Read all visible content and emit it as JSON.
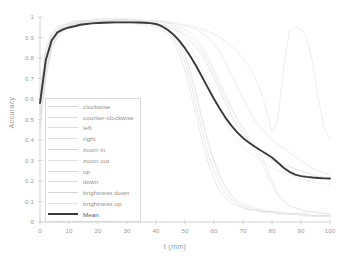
{
  "chart_data": {
    "type": "line",
    "title": "",
    "xlabel": "t (mm)",
    "ylabel": "Accuracy",
    "xlim": [
      0,
      100
    ],
    "ylim": [
      0,
      1
    ],
    "xticks": [
      0,
      10,
      20,
      30,
      40,
      50,
      60,
      70,
      80,
      90,
      100
    ],
    "xtick_labels": [
      "0",
      "10",
      "20",
      "30",
      "40",
      "50",
      "60",
      "70",
      "80",
      "90",
      "100"
    ],
    "yticks": [
      0,
      0.1,
      0.2,
      0.3,
      0.4,
      0.5,
      0.6,
      0.7,
      0.8,
      0.9,
      1
    ],
    "ytick_labels": [
      "0",
      "0.1",
      "0.2",
      "0.3",
      "0.4",
      "0.5",
      "0.6",
      "0.7",
      "0.8",
      "0.9",
      "1"
    ],
    "grid": false,
    "legend_position": "lower-left",
    "x": [
      0,
      2,
      4,
      6,
      8,
      10,
      12,
      14,
      16,
      18,
      20,
      22,
      24,
      26,
      28,
      30,
      32,
      34,
      36,
      38,
      40,
      42,
      44,
      46,
      48,
      50,
      52,
      54,
      56,
      58,
      60,
      62,
      64,
      66,
      68,
      70,
      72,
      74,
      76,
      78,
      80,
      82,
      84,
      86,
      88,
      90,
      92,
      94,
      96,
      98,
      100
    ],
    "series": [
      {
        "name": "clockwise",
        "color": "#d9d9d9",
        "values": [
          0.52,
          0.76,
          0.88,
          0.93,
          0.95,
          0.96,
          0.97,
          0.97,
          0.98,
          0.98,
          0.98,
          0.98,
          0.98,
          0.98,
          0.98,
          0.98,
          0.98,
          0.98,
          0.97,
          0.97,
          0.96,
          0.95,
          0.93,
          0.9,
          0.85,
          0.78,
          0.68,
          0.56,
          0.44,
          0.33,
          0.25,
          0.19,
          0.14,
          0.11,
          0.09,
          0.07,
          0.06,
          0.06,
          0.05,
          0.05,
          0.05,
          0.04,
          0.04,
          0.04,
          0.04,
          0.04,
          0.03,
          0.03,
          0.03,
          0.03,
          0.03
        ]
      },
      {
        "name": "counter-clockwise",
        "color": "#dedede",
        "values": [
          0.55,
          0.74,
          0.86,
          0.92,
          0.94,
          0.96,
          0.96,
          0.97,
          0.97,
          0.97,
          0.98,
          0.98,
          0.98,
          0.98,
          0.98,
          0.98,
          0.98,
          0.97,
          0.97,
          0.97,
          0.96,
          0.95,
          0.94,
          0.92,
          0.88,
          0.82,
          0.73,
          0.62,
          0.5,
          0.39,
          0.3,
          0.23,
          0.17,
          0.13,
          0.1,
          0.08,
          0.07,
          0.06,
          0.06,
          0.05,
          0.05,
          0.05,
          0.04,
          0.04,
          0.04,
          0.04,
          0.04,
          0.03,
          0.03,
          0.03,
          0.03
        ]
      },
      {
        "name": "left",
        "color": "#dcdcdc",
        "values": [
          0.6,
          0.82,
          0.91,
          0.94,
          0.96,
          0.97,
          0.97,
          0.98,
          0.98,
          0.98,
          0.98,
          0.98,
          0.98,
          0.99,
          0.99,
          0.99,
          0.98,
          0.98,
          0.98,
          0.98,
          0.98,
          0.97,
          0.97,
          0.96,
          0.95,
          0.94,
          0.92,
          0.89,
          0.85,
          0.8,
          0.74,
          0.68,
          0.62,
          0.56,
          0.5,
          0.46,
          0.42,
          0.38,
          0.33,
          0.27,
          0.2,
          0.14,
          0.1,
          0.08,
          0.07,
          0.06,
          0.05,
          0.05,
          0.05,
          0.04,
          0.04
        ]
      },
      {
        "name": "right",
        "color": "#e0e0e0",
        "values": [
          0.58,
          0.8,
          0.9,
          0.94,
          0.95,
          0.96,
          0.97,
          0.97,
          0.98,
          0.98,
          0.98,
          0.98,
          0.98,
          0.98,
          0.98,
          0.98,
          0.98,
          0.98,
          0.98,
          0.97,
          0.97,
          0.96,
          0.96,
          0.95,
          0.94,
          0.92,
          0.9,
          0.87,
          0.83,
          0.78,
          0.72,
          0.66,
          0.6,
          0.55,
          0.5,
          0.45,
          0.4,
          0.35,
          0.3,
          0.24,
          0.18,
          0.13,
          0.1,
          0.08,
          0.07,
          0.06,
          0.05,
          0.05,
          0.04,
          0.04,
          0.04
        ]
      },
      {
        "name": "zoom in",
        "color": "#d6d6d6",
        "values": [
          0.45,
          0.7,
          0.84,
          0.9,
          0.93,
          0.95,
          0.96,
          0.96,
          0.97,
          0.97,
          0.97,
          0.97,
          0.97,
          0.97,
          0.97,
          0.97,
          0.97,
          0.96,
          0.96,
          0.96,
          0.95,
          0.94,
          0.92,
          0.88,
          0.82,
          0.74,
          0.63,
          0.51,
          0.39,
          0.29,
          0.21,
          0.15,
          0.12,
          0.09,
          0.08,
          0.07,
          0.06,
          0.06,
          0.05,
          0.05,
          0.05,
          0.04,
          0.04,
          0.04,
          0.04,
          0.03,
          0.03,
          0.03,
          0.03,
          0.03,
          0.03
        ]
      },
      {
        "name": "zoom out",
        "color": "#e2e2e2",
        "values": [
          0.5,
          0.72,
          0.85,
          0.91,
          0.94,
          0.95,
          0.96,
          0.97,
          0.97,
          0.97,
          0.98,
          0.98,
          0.98,
          0.98,
          0.98,
          0.98,
          0.97,
          0.97,
          0.97,
          0.97,
          0.96,
          0.95,
          0.94,
          0.91,
          0.87,
          0.81,
          0.72,
          0.61,
          0.49,
          0.38,
          0.29,
          0.22,
          0.17,
          0.13,
          0.1,
          0.09,
          0.08,
          0.07,
          0.06,
          0.06,
          0.05,
          0.05,
          0.05,
          0.04,
          0.04,
          0.04,
          0.04,
          0.03,
          0.03,
          0.03,
          0.03
        ]
      },
      {
        "name": "up",
        "color": "#dbdbdb",
        "values": [
          0.62,
          0.84,
          0.92,
          0.95,
          0.96,
          0.97,
          0.98,
          0.98,
          0.98,
          0.98,
          0.99,
          0.99,
          0.99,
          0.99,
          0.99,
          0.99,
          0.99,
          0.98,
          0.98,
          0.98,
          0.98,
          0.98,
          0.97,
          0.97,
          0.96,
          0.96,
          0.95,
          0.94,
          0.92,
          0.9,
          0.87,
          0.83,
          0.78,
          0.72,
          0.66,
          0.6,
          0.55,
          0.5,
          0.46,
          0.43,
          0.4,
          0.38,
          0.36,
          0.34,
          0.32,
          0.3,
          0.28,
          0.26,
          0.25,
          0.24,
          0.23
        ]
      },
      {
        "name": "down",
        "color": "#dfdfdf",
        "values": [
          0.64,
          0.85,
          0.92,
          0.95,
          0.96,
          0.97,
          0.98,
          0.98,
          0.98,
          0.99,
          0.99,
          0.99,
          0.99,
          0.99,
          0.99,
          0.99,
          0.99,
          0.99,
          0.98,
          0.98,
          0.98,
          0.98,
          0.98,
          0.97,
          0.97,
          0.96,
          0.96,
          0.95,
          0.94,
          0.93,
          0.92,
          0.9,
          0.88,
          0.86,
          0.83,
          0.8,
          0.76,
          0.71,
          0.64,
          0.55,
          0.44,
          0.5,
          0.75,
          0.93,
          0.95,
          0.94,
          0.9,
          0.78,
          0.6,
          0.46,
          0.4
        ]
      },
      {
        "name": "brightness down",
        "color": "#d4d4d4",
        "values": [
          0.48,
          0.73,
          0.86,
          0.92,
          0.94,
          0.96,
          0.96,
          0.97,
          0.97,
          0.97,
          0.97,
          0.98,
          0.98,
          0.98,
          0.98,
          0.98,
          0.97,
          0.97,
          0.97,
          0.97,
          0.96,
          0.96,
          0.95,
          0.94,
          0.93,
          0.91,
          0.88,
          0.85,
          0.81,
          0.76,
          0.7,
          0.64,
          0.58,
          0.52,
          0.47,
          0.43,
          0.4,
          0.37,
          0.35,
          0.32,
          0.3,
          0.29,
          0.28,
          0.27,
          0.26,
          0.25,
          0.24,
          0.23,
          0.22,
          0.22,
          0.21
        ]
      },
      {
        "name": "brightness up",
        "color": "#e4e4e4",
        "values": [
          0.56,
          0.78,
          0.89,
          0.93,
          0.95,
          0.96,
          0.97,
          0.97,
          0.98,
          0.98,
          0.98,
          0.98,
          0.98,
          0.98,
          0.98,
          0.98,
          0.98,
          0.98,
          0.97,
          0.97,
          0.97,
          0.96,
          0.95,
          0.94,
          0.92,
          0.89,
          0.85,
          0.8,
          0.74,
          0.68,
          0.61,
          0.55,
          0.49,
          0.44,
          0.4,
          0.37,
          0.34,
          0.32,
          0.3,
          0.28,
          0.26,
          0.25,
          0.24,
          0.23,
          0.22,
          0.21,
          0.2,
          0.2,
          0.19,
          0.19,
          0.18
        ]
      },
      {
        "name": "Mean",
        "color": "#3a3a3a",
        "values": [
          0.58,
          0.79,
          0.885,
          0.925,
          0.94,
          0.949,
          0.955,
          0.962,
          0.966,
          0.969,
          0.971,
          0.972,
          0.973,
          0.974,
          0.974,
          0.974,
          0.974,
          0.973,
          0.972,
          0.97,
          0.966,
          0.955,
          0.938,
          0.915,
          0.885,
          0.848,
          0.805,
          0.757,
          0.705,
          0.652,
          0.6,
          0.552,
          0.508,
          0.47,
          0.437,
          0.41,
          0.388,
          0.368,
          0.35,
          0.333,
          0.315,
          0.29,
          0.265,
          0.245,
          0.231,
          0.224,
          0.22,
          0.217,
          0.215,
          0.213,
          0.212
        ]
      }
    ]
  },
  "legend": {
    "items": [
      {
        "label": "clockwise"
      },
      {
        "label": "counter-clockwise"
      },
      {
        "label": "left"
      },
      {
        "label": "right"
      },
      {
        "label": "zoom in"
      },
      {
        "label": "zoom out"
      },
      {
        "label": "up"
      },
      {
        "label": "down"
      },
      {
        "label": "brightness down"
      },
      {
        "label": "brightness up"
      },
      {
        "label": "Mean"
      }
    ]
  }
}
